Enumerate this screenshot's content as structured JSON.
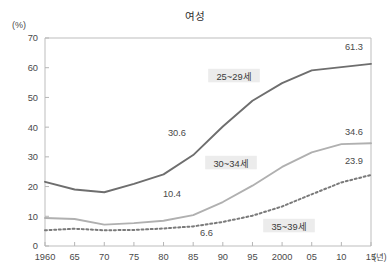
{
  "chart_data": {
    "type": "line",
    "title": "여성",
    "xlabel": "15(년)",
    "ylabel": "(%)",
    "y_unit": "(%)",
    "x_unit": "(년)",
    "grid": false,
    "legend": "inline-labels",
    "xlim": [
      1960,
      2015
    ],
    "ylim": [
      0,
      70
    ],
    "yticks": [
      0,
      10,
      20,
      30,
      40,
      50,
      60,
      70
    ],
    "ytick_labels": [
      "0",
      "10",
      "20",
      "30",
      "40",
      "50",
      "60",
      "70"
    ],
    "x": [
      1960,
      1965,
      1970,
      1975,
      1980,
      1985,
      1990,
      1995,
      2000,
      2005,
      2010,
      2015
    ],
    "xtick_labels": [
      "1960",
      "65",
      "70",
      "75",
      "80",
      "85",
      "90",
      "95",
      "2000",
      "05",
      "10",
      "15"
    ],
    "series": [
      {
        "name": "25~29세",
        "style": "solid",
        "color": "#6e6e6e",
        "values": [
          21.6,
          19.0,
          18.1,
          20.9,
          24.1,
          30.6,
          40.2,
          48.9,
          54.8,
          59.1,
          60.2,
          61.3
        ],
        "start_label": "",
        "end_label": "61.3",
        "mid_label": "30.6",
        "mid_label_year": 1985
      },
      {
        "name": "30~34세",
        "style": "solid",
        "color": "#b0b0b0",
        "values": [
          9.4,
          9.1,
          7.2,
          7.7,
          8.5,
          10.4,
          14.8,
          20.3,
          26.6,
          31.5,
          34.3,
          34.6
        ],
        "end_label": "34.6",
        "mid_label": "10.4",
        "mid_label_year": 1985
      },
      {
        "name": "35~39세",
        "style": "dotted",
        "color": "#7a7a7a",
        "values": [
          5.3,
          5.8,
          5.3,
          5.4,
          5.9,
          6.6,
          8.1,
          10.2,
          13.3,
          17.4,
          21.4,
          23.9
        ],
        "end_label": "23.9",
        "mid_label": "6.6",
        "mid_label_year": 1985
      }
    ],
    "annotations": [
      {
        "text": "25~29세",
        "kind": "series-label",
        "series": "25~29세"
      },
      {
        "text": "30~34세",
        "kind": "series-label",
        "series": "30~34세"
      },
      {
        "text": "35~39세",
        "kind": "series-label",
        "series": "35~39세"
      },
      {
        "text": "61.3",
        "kind": "value",
        "series": "25~29세"
      },
      {
        "text": "30.6",
        "kind": "value",
        "series": "25~29세"
      },
      {
        "text": "34.6",
        "kind": "value",
        "series": "30~34세"
      },
      {
        "text": "10.4",
        "kind": "value",
        "series": "30~34세"
      },
      {
        "text": "23.9",
        "kind": "value",
        "series": "35~39세"
      },
      {
        "text": "6.6",
        "kind": "value",
        "series": "35~39세"
      }
    ]
  },
  "layout": {
    "plot_left": 45,
    "plot_right": 371,
    "plot_top": 38,
    "plot_bottom": 246
  },
  "labels": {
    "series_label_positions": [
      {
        "text": "25~29세",
        "x": 234,
        "y": 76
      },
      {
        "text": "30~34세",
        "x": 231,
        "y": 163
      },
      {
        "text": "35~39세",
        "x": 289,
        "y": 226
      }
    ],
    "value_label_positions": [
      {
        "text": "61.3",
        "x": 363,
        "y": 50,
        "anchor": "end"
      },
      {
        "text": "30.6",
        "x": 186,
        "y": 136,
        "anchor": "end"
      },
      {
        "text": "34.6",
        "x": 363,
        "y": 135,
        "anchor": "end"
      },
      {
        "text": "10.4",
        "x": 181,
        "y": 197,
        "anchor": "end"
      },
      {
        "text": "23.9",
        "x": 363,
        "y": 164,
        "anchor": "end"
      },
      {
        "text": "6.6",
        "x": 213,
        "y": 236,
        "anchor": "end"
      }
    ]
  }
}
